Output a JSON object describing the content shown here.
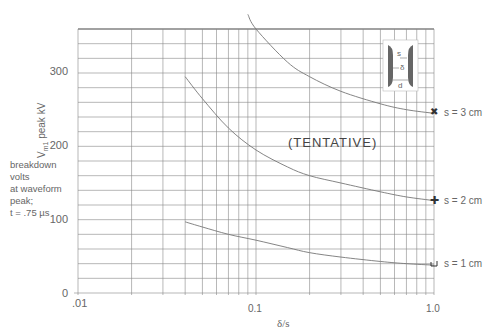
{
  "chart_data": {
    "type": "line",
    "title": "",
    "xlabel": "δ/s",
    "ylabel": "Vm1 peak kV",
    "x_scale": "log",
    "xlim": [
      0.01,
      1.0
    ],
    "ylim": [
      0,
      360
    ],
    "x_tick_labels": [
      ".01",
      "0.1",
      "1.0"
    ],
    "y_tick_labels": [
      "0",
      "100",
      "200",
      "300"
    ],
    "grid": true,
    "annotation": "(TENTATIVE)",
    "side_note": [
      "breakdown",
      "volts",
      "at waveform",
      "peak;",
      "t = .75 µs"
    ],
    "inset": {
      "labels": [
        "s",
        "δ",
        "d"
      ]
    },
    "series": [
      {
        "name": "s = 3 cm",
        "x": [
          0.09,
          0.1,
          0.15,
          0.2,
          0.3,
          0.5,
          0.7,
          1.0
        ],
        "y": [
          380,
          360,
          315,
          295,
          275,
          258,
          250,
          245
        ]
      },
      {
        "name": "s = 2 cm",
        "x": [
          0.04,
          0.05,
          0.07,
          0.1,
          0.15,
          0.2,
          0.3,
          0.5,
          0.7,
          1.0
        ],
        "y": [
          295,
          265,
          225,
          195,
          172,
          160,
          150,
          138,
          131,
          126
        ]
      },
      {
        "name": "s = 1 cm",
        "x": [
          0.04,
          0.05,
          0.07,
          0.1,
          0.15,
          0.2,
          0.3,
          0.5,
          0.7,
          1.0
        ],
        "y": [
          97,
          90,
          80,
          72,
          62,
          55,
          49,
          43,
          40,
          38
        ]
      }
    ]
  },
  "labels": {
    "ylabel_main": "V",
    "ylabel_sub": "m1",
    "ylabel_rest": " peak kV",
    "x_axis_title": "δ/s",
    "x_01": ".01",
    "x_1": "0.1",
    "x_10": "1.0",
    "y0": "0",
    "y100": "100",
    "y200": "200",
    "y300": "300",
    "side1": "breakdown",
    "side2": "volts",
    "side3": "at waveform",
    "side4": "peak;",
    "side5": "t = .75 µs",
    "tentative": "(TENTATIVE)",
    "s3": "s = 3 cm",
    "s2": "s = 2 cm",
    "s1": "s = 1 cm",
    "inset_s": "s",
    "inset_delta": "δ",
    "inset_d": "d"
  }
}
